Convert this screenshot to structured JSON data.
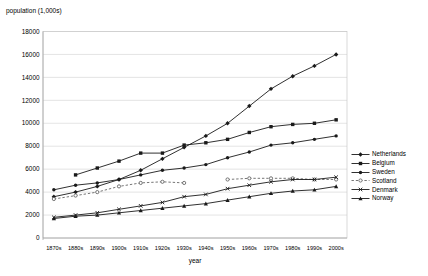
{
  "chart_data": {
    "type": "line",
    "title": "",
    "ylabel": "population (1,000s)",
    "xlabel": "year",
    "ylim": [
      0,
      18000
    ],
    "ytick_step": 2000,
    "yticks": [
      0,
      2000,
      4000,
      6000,
      8000,
      10000,
      12000,
      14000,
      16000,
      18000
    ],
    "grid": true,
    "legend_position": "right",
    "categories": [
      "1870s",
      "1880s",
      "1890s",
      "1900s",
      "1910s",
      "1920s",
      "1930s",
      "1940s",
      "1950s",
      "1960s",
      "1970s",
      "1980s",
      "1990s",
      "2000s"
    ],
    "series": [
      {
        "name": "Netherlands",
        "marker": "diamond",
        "line": "solid",
        "color": "#1a1a1a",
        "values": [
          3600,
          4000,
          4500,
          5100,
          5900,
          6900,
          7900,
          8900,
          10000,
          11500,
          13000,
          14100,
          15000,
          16000
        ]
      },
      {
        "name": "Belgium",
        "marker": "square",
        "line": "solid",
        "color": "#1a1a1a",
        "values": [
          null,
          5500,
          6100,
          6700,
          7400,
          7400,
          8100,
          8300,
          8600,
          9200,
          9700,
          9900,
          10000,
          10300
        ]
      },
      {
        "name": "Sweden",
        "marker": "circle",
        "line": "solid",
        "color": "#1a1a1a",
        "values": [
          4200,
          4600,
          4800,
          5100,
          5500,
          5900,
          6100,
          6400,
          7000,
          7500,
          8100,
          8300,
          8600,
          8900
        ]
      },
      {
        "name": "Scotland",
        "marker": "circle-open",
        "line": "dashed",
        "color": "#666666",
        "values": [
          3400,
          3700,
          4000,
          4500,
          4800,
          4900,
          4800,
          null,
          5100,
          5200,
          5200,
          5200,
          5100,
          5100
        ]
      },
      {
        "name": "Denmark",
        "marker": "x",
        "line": "solid",
        "color": "#1a1a1a",
        "values": [
          1800,
          2000,
          2200,
          2500,
          2800,
          3100,
          3600,
          3800,
          4300,
          4600,
          4900,
          5100,
          5100,
          5300
        ]
      },
      {
        "name": "Norway",
        "marker": "triangle",
        "line": "solid",
        "color": "#1a1a1a",
        "values": [
          1700,
          1900,
          2000,
          2200,
          2400,
          2600,
          2800,
          3000,
          3300,
          3600,
          3900,
          4100,
          4200,
          4500
        ]
      }
    ],
    "colors": {
      "gridline": "#d9d9d9",
      "axis": "#a6a6a6",
      "plot_border": "#c9c9c9",
      "background": "#ffffff"
    }
  }
}
